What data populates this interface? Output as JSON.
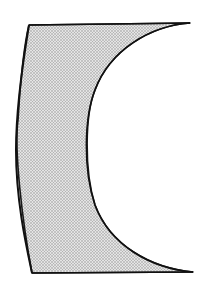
{
  "diagram": {
    "type": "lens-cross-section",
    "shape": "concave lens element (one surface slightly convex, one deeply concave)",
    "fill": "stippled gray",
    "colors": {
      "outline": "#1a1a1a",
      "fill_base": "#e2e2e2",
      "stipple": "#8a8a8a",
      "background": "#ffffff"
    }
  }
}
